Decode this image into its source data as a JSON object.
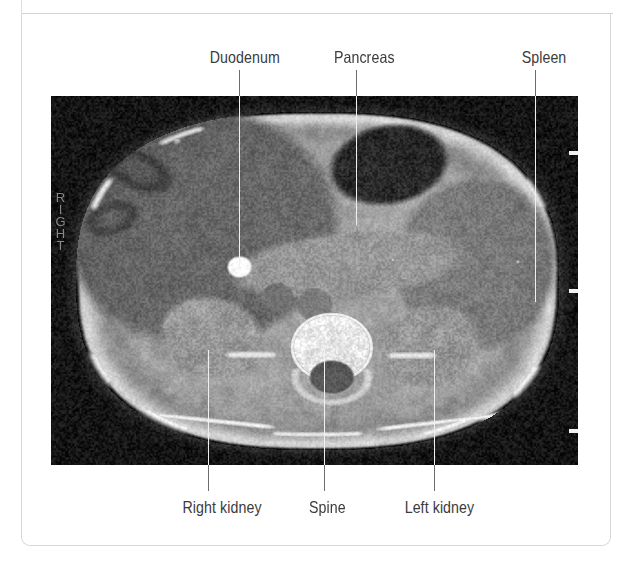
{
  "figure": {
    "kind": "labelled-ct-scan",
    "modality": "CT",
    "view": "axial abdominal slice",
    "orientation_marker": "RIGHT",
    "background_color": "#ffffff",
    "frame_color": "#d8d8d8",
    "label_color": "#3b3b3b",
    "leader_color_on_paper": "#6d6d6d",
    "leader_color_on_image": "#f0f0f0"
  },
  "scan": {
    "alt": "Axial CT image of the upper abdomen",
    "tick_marks": 3,
    "tick_color": "#f2f2f2"
  },
  "annotations": {
    "top": [
      {
        "id": "duodenum",
        "label": "Duodenum",
        "label_center_x": 239,
        "label_baseline_y": 62,
        "leader_x": 239,
        "leader_from_y": 70,
        "leader_to_y": 268
      },
      {
        "id": "pancreas",
        "label": "Pancreas",
        "label_center_x": 359,
        "label_baseline_y": 62,
        "leader_x": 356,
        "leader_from_y": 70,
        "leader_to_y": 225
      },
      {
        "id": "spleen",
        "label": "Spleen",
        "label_center_x": 540,
        "label_baseline_y": 62,
        "leader_x": 535,
        "leader_from_y": 70,
        "leader_to_y": 302
      }
    ],
    "bottom": [
      {
        "id": "right-kidney",
        "label": "Right kidney",
        "label_center_x": 216,
        "label_top_y": 498,
        "leader_x": 208,
        "leader_from_y": 350,
        "leader_to_y": 491
      },
      {
        "id": "spine",
        "label": "Spine",
        "label_center_x": 324,
        "label_top_y": 498,
        "leader_x": 324,
        "leader_from_y": 350,
        "leader_to_y": 491
      },
      {
        "id": "left-kidney",
        "label": "Left kidney",
        "label_center_x": 434,
        "label_top_y": 498,
        "leader_x": 434,
        "leader_from_y": 350,
        "leader_to_y": 491
      }
    ]
  }
}
